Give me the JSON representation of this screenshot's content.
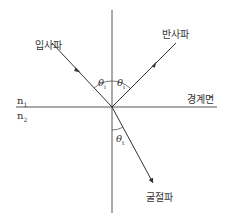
{
  "diagram": {
    "title": "",
    "labels": {
      "incident": "입사파",
      "reflected": "반사파",
      "refracted": "굴절파",
      "boundary": "경계면",
      "n1": "n",
      "n1_sub": "1",
      "n2": "n",
      "n2_sub": "2",
      "theta_i_left": "θ",
      "theta_i_left_sub": "i",
      "theta_i_right": "θ",
      "theta_i_right_sub": "i",
      "theta_t": "θ",
      "theta_t_sub": "t"
    },
    "colors": {
      "line": "#333333",
      "text": "#333333",
      "background": "#ffffff"
    }
  }
}
